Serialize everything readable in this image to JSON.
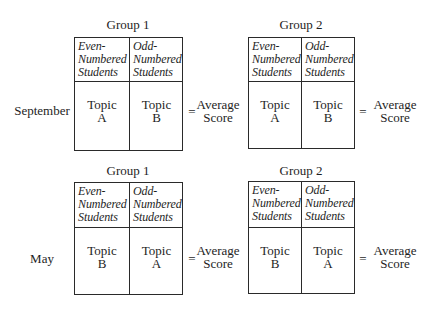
{
  "rows": [
    {
      "label": "September",
      "groups": [
        {
          "title": "Group 1",
          "columns": [
            {
              "header": [
                "Even-",
                "Numbered",
                "Students"
              ],
              "topic": [
                "Topic",
                "A"
              ]
            },
            {
              "header": [
                "Odd-",
                "Numbered",
                "Students"
              ],
              "topic": [
                "Topic",
                "B"
              ]
            }
          ],
          "equals": "=",
          "result": [
            "Average",
            "Score"
          ]
        },
        {
          "title": "Group 2",
          "columns": [
            {
              "header": [
                "Even-",
                "Numbered",
                "Students"
              ],
              "topic": [
                "Topic",
                "A"
              ]
            },
            {
              "header": [
                "Odd-",
                "Numbered",
                "Students"
              ],
              "topic": [
                "Topic",
                "B"
              ]
            }
          ],
          "equals": "=",
          "result": [
            "Average",
            "Score"
          ]
        }
      ]
    },
    {
      "label": "May",
      "groups": [
        {
          "title": "Group 1",
          "columns": [
            {
              "header": [
                "Even-",
                "Numbered",
                "Students"
              ],
              "topic": [
                "Topic",
                "B"
              ]
            },
            {
              "header": [
                "Odd-",
                "Numbered",
                "Students"
              ],
              "topic": [
                "Topic",
                "A"
              ]
            }
          ],
          "equals": "=",
          "result": [
            "Average",
            "Score"
          ]
        },
        {
          "title": "Group 2",
          "columns": [
            {
              "header": [
                "Even-",
                "Numbered",
                "Students"
              ],
              "topic": [
                "Topic",
                "B"
              ]
            },
            {
              "header": [
                "Odd-",
                "Numbered",
                "Students"
              ],
              "topic": [
                "Topic",
                "A"
              ]
            }
          ],
          "equals": "=",
          "result": [
            "Average",
            "Score"
          ]
        }
      ]
    }
  ]
}
